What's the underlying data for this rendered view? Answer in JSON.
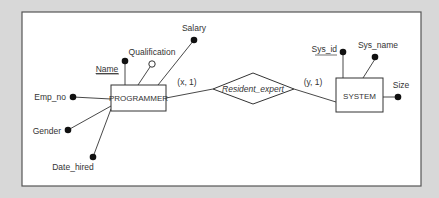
{
  "diagram": {
    "type": "er-diagram",
    "entities": {
      "programmer": "PROGRAMMER",
      "system": "SYSTEM"
    },
    "relationship": {
      "name": "Resident_expert",
      "left_cardinality": "(x, 1)",
      "right_cardinality": "(y, 1)"
    },
    "programmer_attributes": {
      "name": "Name",
      "qualification": "Qualification",
      "salary": "Salary",
      "emp_no": "Emp_no",
      "gender": "Gender",
      "date_hired": "Date_hired"
    },
    "system_attributes": {
      "sys_id": "Sys_id",
      "sys_name": "Sys_name",
      "size": "Size"
    },
    "key_attributes": [
      "Name",
      "Sys_id"
    ],
    "optional_attributes": [
      "Qualification"
    ],
    "colors": {
      "background": "#d8d8d8",
      "canvas": "#ffffff",
      "stroke": "#333333"
    }
  }
}
